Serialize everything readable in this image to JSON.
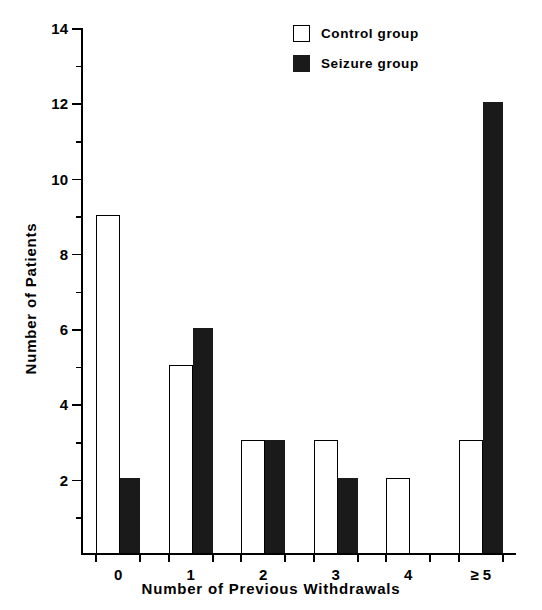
{
  "chart_data": {
    "type": "bar",
    "title": "",
    "xlabel": "Number of Previous Withdrawals",
    "ylabel": "Number of Patients",
    "categories": [
      "0",
      "1",
      "2",
      "3",
      "4",
      "≥ 5"
    ],
    "series": [
      {
        "name": "Control group",
        "values": [
          9,
          5,
          3,
          3,
          2,
          3
        ],
        "color": "#ffffff",
        "edge_color": "#000000",
        "style": "open"
      },
      {
        "name": "Seizure group",
        "values": [
          2,
          6,
          3,
          2,
          0,
          12
        ],
        "color": "#1a1a1a",
        "edge_color": "#1a1a1a",
        "style": "filled"
      }
    ],
    "ylim": [
      0,
      14
    ],
    "ytick_labels": [
      "2",
      "4",
      "6",
      "8",
      "10",
      "12",
      "14"
    ],
    "ytick_values": [
      2,
      4,
      6,
      8,
      10,
      12,
      14
    ],
    "yminor_tick_values": [
      1,
      3,
      5,
      7,
      9,
      11,
      13
    ],
    "grid": false,
    "legend_position": "top-right"
  },
  "legend": {
    "items": [
      {
        "label": "Control group",
        "swatch": "open-square-icon"
      },
      {
        "label": "Seizure group",
        "swatch": "filled-square-icon"
      }
    ]
  },
  "axes": {
    "x_title": "Number of Previous Withdrawals",
    "y_title": "Number of Patients"
  }
}
